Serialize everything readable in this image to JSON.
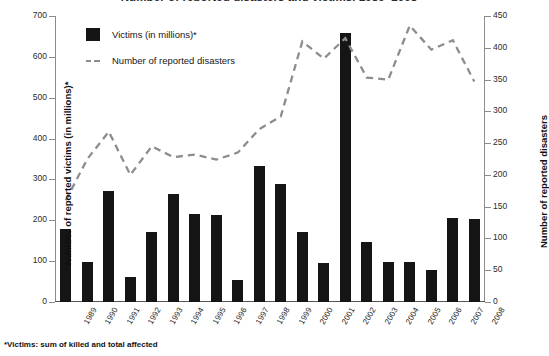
{
  "chart_data": {
    "type": "bar",
    "title": "Number of reported disasters and victims, 1989–2008",
    "xlabel": "",
    "ylabel": "Number of reported victims (in millions)*",
    "ylabel_secondary": "Number of reported disasters",
    "categories": [
      "1989",
      "1990",
      "1991",
      "1992",
      "1993",
      "1994",
      "1995",
      "1996",
      "1997",
      "1998",
      "1999",
      "2000",
      "2001",
      "2002",
      "2003",
      "2004",
      "2005",
      "2006",
      "2007",
      "2008"
    ],
    "ylim": [
      0,
      700
    ],
    "ylim_secondary": [
      0,
      450
    ],
    "yticks": [
      0,
      100,
      200,
      300,
      400,
      500,
      600,
      700
    ],
    "yticks_secondary": [
      0,
      50,
      100,
      150,
      200,
      250,
      300,
      350,
      400,
      450
    ],
    "grid": false,
    "legend_position": "top-left",
    "series": [
      {
        "name": "Victims (in millions)*",
        "type": "bar",
        "axis": "left",
        "color": "#151515",
        "values": [
          178,
          98,
          272,
          62,
          172,
          265,
          216,
          212,
          55,
          333,
          288,
          172,
          96,
          658,
          148,
          97,
          99,
          78,
          205,
          203
        ]
      },
      {
        "name": "Number of reported disasters",
        "type": "line",
        "axis": "right",
        "color": "#8d8d8d",
        "style": "dashed",
        "values": [
          160,
          225,
          268,
          200,
          245,
          228,
          232,
          224,
          235,
          272,
          292,
          410,
          383,
          415,
          353,
          350,
          435,
          397,
          412,
          347
        ]
      }
    ],
    "footnote": "*Victims: sum of killed and total affected"
  },
  "legend": {
    "items": [
      {
        "label": "Victims (in millions)*",
        "marker": "filled-square"
      },
      {
        "label": "Number of reported disasters",
        "marker": "dashed-line"
      }
    ]
  },
  "colors": {
    "bar": "#151515",
    "line": "#8d8d8d",
    "axis": "#8c8c8c",
    "text": "#1a1a1a",
    "background": "#ffffff"
  }
}
